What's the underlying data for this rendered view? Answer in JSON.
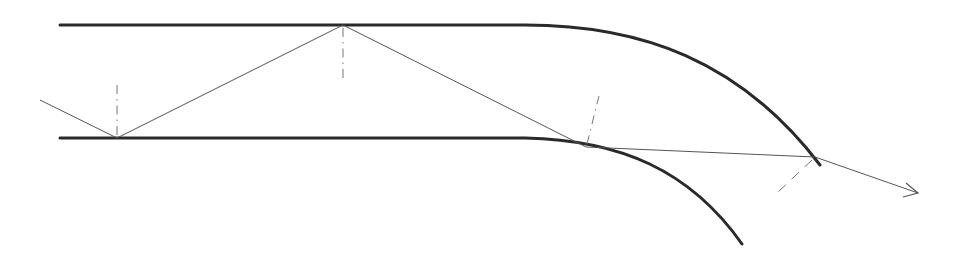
{
  "diagram": {
    "title": "",
    "colors": {
      "wall": "#2a2a2a",
      "ray": "#555555",
      "normal": "#777777",
      "background": "#ffffff"
    },
    "walls": {
      "top": {
        "straight_from": [
          60,
          25
        ],
        "straight_to": [
          530,
          25
        ],
        "bend_end": [
          820,
          165
        ]
      },
      "bottom": {
        "straight_from": [
          60,
          138
        ],
        "straight_to": [
          530,
          138
        ],
        "bend_end": [
          742,
          244
        ]
      }
    },
    "ray_points": [
      [
        40,
        100
      ],
      [
        117,
        138
      ],
      [
        343,
        25
      ],
      [
        586,
        147
      ],
      [
        815,
        157
      ],
      [
        918,
        193
      ]
    ],
    "normals": [
      {
        "at": [
          117,
          138
        ],
        "to": [
          117,
          80
        ],
        "style": "dash-dot"
      },
      {
        "at": [
          343,
          25
        ],
        "to": [
          343,
          83
        ],
        "style": "dash-dot"
      },
      {
        "at": [
          586,
          147
        ],
        "to": [
          599,
          96
        ],
        "style": "dash-dot"
      },
      {
        "at": [
          815,
          157
        ],
        "to": [
          778,
          192
        ],
        "style": "dashed"
      }
    ],
    "labels": []
  }
}
